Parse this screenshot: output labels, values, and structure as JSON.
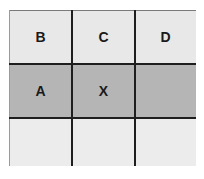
{
  "grid": {
    "rows": [
      {
        "cells": [
          {
            "label": "B"
          },
          {
            "label": "C"
          },
          {
            "label": "D"
          }
        ],
        "fill": "#e8e8e8"
      },
      {
        "cells": [
          {
            "label": "A"
          },
          {
            "label": "X"
          },
          {
            "label": ""
          }
        ],
        "fill": "#b5b5b5"
      },
      {
        "cells": [
          {
            "label": ""
          },
          {
            "label": ""
          },
          {
            "label": ""
          }
        ],
        "fill": "#ececec"
      }
    ],
    "line_color": "#1e1e1e"
  }
}
